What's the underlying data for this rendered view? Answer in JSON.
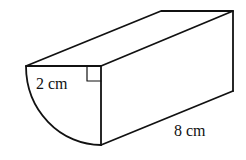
{
  "diagram": {
    "type": "3d-solid",
    "labels": {
      "radius": "2 cm",
      "length": "8 cm"
    },
    "right_angle_marker": true,
    "colors": {
      "stroke": "#111111",
      "background": "#ffffff"
    }
  }
}
